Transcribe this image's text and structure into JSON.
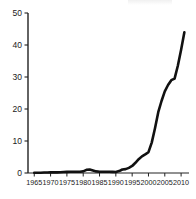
{
  "chart_data": {
    "type": "line",
    "title": "",
    "subtitle": "",
    "xlabel": "",
    "ylabel": "",
    "xlim": [
      1964,
      2011.5
    ],
    "ylim": [
      0,
      50
    ],
    "grid": false,
    "legend": null,
    "legend_position": "none",
    "line_color": "#111111",
    "axis_color": "#222222",
    "x_ticks": [
      1965,
      1970,
      1975,
      1980,
      1985,
      1990,
      1995,
      2000,
      2005,
      2010
    ],
    "x_tick_labels": [
      "1965",
      "1970",
      "1975",
      "1980",
      "1985",
      "1990",
      "1995",
      "2000",
      "2005",
      "2010"
    ],
    "y_ticks": [
      0,
      10,
      20,
      30,
      40,
      50
    ],
    "y_tick_labels": [
      "0",
      "10",
      "20",
      "30",
      "40",
      "50"
    ],
    "series": [
      {
        "name": "",
        "x": [
          1965,
          1966,
          1967,
          1968,
          1969,
          1970,
          1971,
          1972,
          1973,
          1974,
          1975,
          1976,
          1977,
          1978,
          1979,
          1980,
          1981,
          1982,
          1983,
          1984,
          1985,
          1986,
          1987,
          1988,
          1989,
          1990,
          1991,
          1992,
          1993,
          1994,
          1995,
          1996,
          1997,
          1998,
          1999,
          2000,
          2001,
          2002,
          2003,
          2004,
          2005,
          2006,
          2007,
          2008,
          2009,
          2010,
          2011
        ],
        "values": [
          0.1,
          0.1,
          0.1,
          0.15,
          0.15,
          0.2,
          0.2,
          0.2,
          0.25,
          0.3,
          0.35,
          0.4,
          0.4,
          0.4,
          0.4,
          0.5,
          1.0,
          1.1,
          0.8,
          0.5,
          0.4,
          0.4,
          0.4,
          0.4,
          0.35,
          0.3,
          0.6,
          1.1,
          1.2,
          1.6,
          2.2,
          3.2,
          4.3,
          5.2,
          5.8,
          6.5,
          9.5,
          14.0,
          19.0,
          22.5,
          25.5,
          27.5,
          29.0,
          29.5,
          33.5,
          38.5,
          44.0
        ]
      }
    ]
  }
}
